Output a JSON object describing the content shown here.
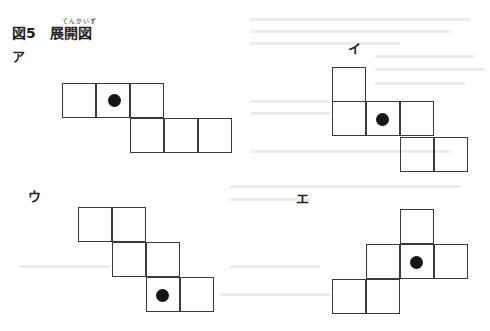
{
  "figure": {
    "number": "図5",
    "title": "展開図",
    "ruby": "てんかいず"
  },
  "options": [
    {
      "label": "ア",
      "label_pos": [
        12,
        46
      ],
      "cells": [
        [
          62,
          83
        ],
        [
          96,
          83
        ],
        [
          130,
          83
        ],
        [
          130,
          118
        ],
        [
          164,
          118
        ],
        [
          198,
          118
        ]
      ],
      "dot": [
        108,
        94
      ]
    },
    {
      "label": "イ",
      "label_pos": [
        348,
        38
      ],
      "cells": [
        [
          332,
          67
        ],
        [
          332,
          101
        ],
        [
          366,
          101
        ],
        [
          400,
          101
        ],
        [
          400,
          137
        ],
        [
          434,
          137
        ]
      ],
      "dot": [
        376,
        113
      ]
    },
    {
      "label": "ウ",
      "label_pos": [
        28,
        186
      ],
      "cells": [
        [
          78,
          207
        ],
        [
          112,
          207
        ],
        [
          112,
          242
        ],
        [
          146,
          242
        ],
        [
          146,
          277
        ],
        [
          180,
          277
        ]
      ],
      "dot": [
        156,
        289
      ]
    },
    {
      "label": "エ",
      "label_pos": [
        296,
        188
      ],
      "cells": [
        [
          400,
          209
        ],
        [
          366,
          244
        ],
        [
          400,
          244
        ],
        [
          434,
          244
        ],
        [
          332,
          279
        ],
        [
          366,
          279
        ]
      ],
      "dot": [
        410,
        256
      ]
    }
  ],
  "colors": {
    "line": "#3a3a3a",
    "dot": "#151515",
    "bleed": "#ececec"
  }
}
